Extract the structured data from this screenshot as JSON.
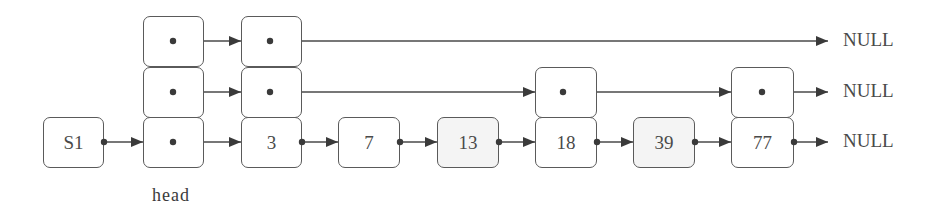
{
  "diagram": {
    "type": "skip-list",
    "list_label": "S1",
    "head_label": "head",
    "null_label": "NULL",
    "levels": 3,
    "colors": {
      "stroke": "#5a5a5a",
      "text": "#4a4a4a",
      "shaded_fill": "#f4f4f4",
      "background": "#ffffff"
    },
    "nodes": [
      {
        "id": "S1",
        "label": "S1",
        "height": 1,
        "shaded": false
      },
      {
        "id": "head",
        "label": "",
        "height": 3,
        "shaded": false
      },
      {
        "id": "n3",
        "label": "3",
        "height": 3,
        "shaded": false
      },
      {
        "id": "n7",
        "label": "7",
        "height": 1,
        "shaded": false
      },
      {
        "id": "n13",
        "label": "13",
        "height": 1,
        "shaded": true
      },
      {
        "id": "n18",
        "label": "18",
        "height": 2,
        "shaded": false
      },
      {
        "id": "n39",
        "label": "39",
        "height": 1,
        "shaded": true
      },
      {
        "id": "n77",
        "label": "77",
        "height": 2,
        "shaded": false
      }
    ],
    "links": {
      "level_2": [
        "head",
        "n3",
        "NULL"
      ],
      "level_1": [
        "head",
        "n3",
        "n18",
        "n77",
        "NULL"
      ],
      "level_0": [
        "S1",
        "head",
        "n3",
        "n7",
        "n13",
        "n18",
        "n39",
        "n77",
        "NULL"
      ]
    },
    "null_labels": [
      "NULL",
      "NULL",
      "NULL"
    ]
  }
}
